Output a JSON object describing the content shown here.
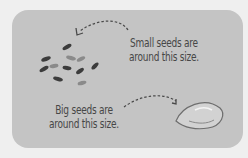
{
  "card": {
    "small_label_line1": "Small seeds are",
    "small_label_line2": "around this size.",
    "big_label_line1": "Big seeds are",
    "big_label_line2": "around this size."
  },
  "colors": {
    "background": "#efefef",
    "card": "#c4c4c4",
    "text": "#474747",
    "seed_dark": "#3c3c3c",
    "seed_light": "#8a8a8a"
  }
}
